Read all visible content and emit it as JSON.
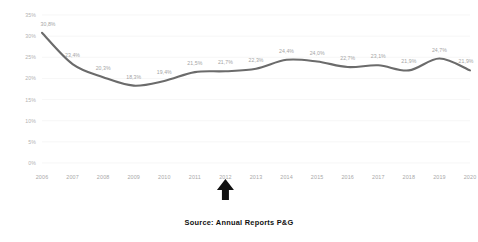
{
  "chart_data": {
    "type": "line",
    "title": "",
    "subtitle": "",
    "xlabel": "",
    "ylabel": "",
    "categories": [
      "2006",
      "2007",
      "2008",
      "2009",
      "2010",
      "2011",
      "2012",
      "2013",
      "2014",
      "2015",
      "2016",
      "2017",
      "2018",
      "2019",
      "2020"
    ],
    "values": [
      30.8,
      23.4,
      20.3,
      18.3,
      19.4,
      21.5,
      21.7,
      22.3,
      24.4,
      24.0,
      22.7,
      23.1,
      21.9,
      24.7,
      21.9
    ],
    "point_labels": [
      "30,8%",
      "23,4%",
      "20,3%",
      "18,3%",
      "19,4%",
      "21,5%",
      "21,7%",
      "22,3%",
      "24,4%",
      "24,0%",
      "22,7%",
      "23,1%",
      "21,9%",
      "24,7%",
      "21,9%"
    ],
    "series": [
      {
        "name": "",
        "values": [
          30.8,
          23.4,
          20.3,
          18.3,
          19.4,
          21.5,
          21.7,
          22.3,
          24.4,
          24.0,
          22.7,
          23.1,
          21.9,
          24.7,
          21.9
        ],
        "color": "#6b6b6b"
      }
    ],
    "ylim": [
      0,
      35
    ],
    "yticks": [
      0,
      5,
      10,
      15,
      20,
      25,
      30,
      35
    ],
    "ytick_labels": [
      "0%",
      "5%",
      "10%",
      "15%",
      "20%",
      "25%",
      "30%",
      "35%"
    ],
    "grid": true,
    "legend": false,
    "legend_position": "none",
    "line_color": "#6b6b6b",
    "grid_color": "#f2f2f2",
    "label_color": "#a5a5a5",
    "axis_label_color": "#a8a8a8",
    "background": "#ffffff",
    "annotations": [
      {
        "type": "arrow-up",
        "target_category": "2012",
        "color": "#111111",
        "name": "up-arrow-annotation-2012"
      }
    ]
  },
  "caption": {
    "source_text": "Source: Annual Reports P&G"
  }
}
